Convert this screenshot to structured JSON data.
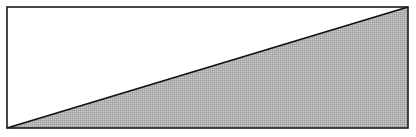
{
  "diagram": {
    "canvas": {
      "width": 416,
      "height": 137
    },
    "rectangle": {
      "x": 7,
      "y": 7,
      "width": 401,
      "height": 121,
      "stroke": "#1a1a1a",
      "stroke_width": 1.6,
      "fill": "#ffffff"
    },
    "upper_triangle": {
      "points": "7,128 7,7 408,7",
      "fill": "#ffffff"
    },
    "shaded_triangle": {
      "points": "7,128 408,7 408,128",
      "fill": "#b3b3b3",
      "pattern_dark": "#9c9c9c",
      "pattern_light": "#c6c6c6"
    },
    "diagonal": {
      "x1": 7,
      "y1": 128,
      "x2": 408,
      "y2": 7,
      "stroke": "#111111",
      "stroke_width": 1.8
    }
  }
}
